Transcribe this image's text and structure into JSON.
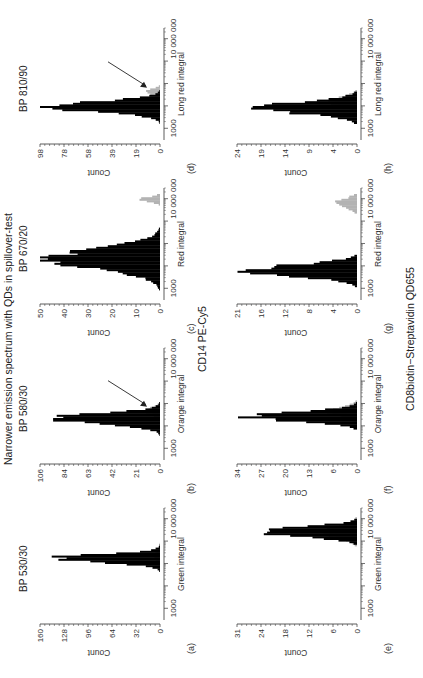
{
  "figure": {
    "title": "Narrower emission spectrum with QDs in spillover-test",
    "row_labels": [
      "CD14 PE-Cy5",
      "CD8biotin−Streptavidin QD655"
    ],
    "colors": {
      "primary": "#000000",
      "spillover": "#b3b3b3",
      "axis": "#333333"
    }
  },
  "panels": [
    {
      "id": "a",
      "label": "(a)",
      "title": "BP 530/30",
      "xlabel": "Green integral",
      "ylabel": "Count",
      "yticks": [
        "0",
        "32",
        "64",
        "96",
        "128",
        "160"
      ],
      "xticks": [
        "1000",
        "10 000 000"
      ],
      "arrow": false
    },
    {
      "id": "b",
      "label": "(b)",
      "title": "BP 580/30",
      "xlabel": "Orange integral",
      "ylabel": "Count",
      "yticks": [
        "0",
        "21",
        "42",
        "63",
        "84",
        "106"
      ],
      "xticks": [
        "1000",
        "10 000 000"
      ],
      "arrow": true
    },
    {
      "id": "c",
      "label": "(c)",
      "title": "BP 670/20",
      "xlabel": "Red integral",
      "ylabel": "Count",
      "yticks": [
        "0",
        "10",
        "20",
        "30",
        "40",
        "50"
      ],
      "xticks": [
        "1000",
        "10 000 000"
      ],
      "arrow": false
    },
    {
      "id": "d",
      "label": "(d)",
      "title": "BP 810/90",
      "xlabel": "Long red integral",
      "ylabel": "Count",
      "yticks": [
        "0",
        "19",
        "39",
        "58",
        "78",
        "98"
      ],
      "xticks": [
        "1000",
        "10 000 000"
      ],
      "arrow": true
    },
    {
      "id": "e",
      "label": "(e)",
      "title": "",
      "xlabel": "Green integral",
      "ylabel": "Count",
      "yticks": [
        "0",
        "6",
        "12",
        "18",
        "24",
        "31"
      ],
      "xticks": [
        "1000",
        "10 000 000"
      ],
      "arrow": false
    },
    {
      "id": "f",
      "label": "(f)",
      "title": "",
      "xlabel": "Orange integral",
      "ylabel": "Count",
      "yticks": [
        "0",
        "6",
        "13",
        "20",
        "27",
        "34"
      ],
      "xticks": [
        "1000",
        "10 000 000"
      ],
      "arrow": false
    },
    {
      "id": "g",
      "label": "(g)",
      "title": "",
      "xlabel": "Red integral",
      "ylabel": "Count",
      "yticks": [
        "0",
        "4",
        "8",
        "12",
        "16",
        "21"
      ],
      "xticks": [
        "1000",
        "10 000 000"
      ],
      "arrow": false
    },
    {
      "id": "h",
      "label": "(h)",
      "title": "",
      "xlabel": "Long red integral",
      "ylabel": "Count",
      "yticks": [
        "0",
        "4",
        "9",
        "14",
        "19",
        "24"
      ],
      "xticks": [
        "1000",
        "10 000 000"
      ],
      "arrow": false
    }
  ],
  "chart_data": [
    {
      "type": "bar",
      "panel": "a",
      "title": "BP 530/30",
      "xlabel": "Green integral (log)",
      "ylabel": "Count",
      "ylim": [
        0,
        160
      ],
      "xscale": "log",
      "xlim": [
        300,
        30000000
      ],
      "series": [
        {
          "name": "CD14 PE-Cy5",
          "color": "#000000",
          "peak_x": 160000,
          "peak_y": 155,
          "width_decades": 0.35
        },
        {
          "name": "spillover",
          "color": "#b3b3b3",
          "peak_x": 200000,
          "peak_y": 8,
          "width_decades": 0.5
        }
      ]
    },
    {
      "type": "bar",
      "panel": "b",
      "title": "BP 580/30",
      "xlabel": "Orange integral (log)",
      "ylabel": "Count",
      "ylim": [
        0,
        106
      ],
      "xscale": "log",
      "xlim": [
        300,
        30000000
      ],
      "series": [
        {
          "name": "CD14 PE-Cy5",
          "color": "#000000",
          "peak_x": 20000,
          "peak_y": 103,
          "width_decades": 0.45
        },
        {
          "name": "spillover",
          "color": "#b3b3b3",
          "peak_x": 45000,
          "peak_y": 14,
          "width_decades": 0.3
        }
      ]
    },
    {
      "type": "bar",
      "panel": "c",
      "title": "BP 670/20",
      "xlabel": "Red integral (log)",
      "ylabel": "Count",
      "ylim": [
        0,
        50
      ],
      "xscale": "log",
      "xlim": [
        300,
        30000000
      ],
      "series": [
        {
          "name": "CD14 PE-Cy5",
          "color": "#000000",
          "peak_x": 20000,
          "peak_y": 48,
          "width_decades": 0.9
        },
        {
          "name": "spillover",
          "color": "#b3b3b3",
          "peak_x": 9000000,
          "peak_y": 9,
          "width_decades": 0.2
        }
      ]
    },
    {
      "type": "bar",
      "panel": "d",
      "title": "BP 810/90",
      "xlabel": "Long red integral (log)",
      "ylabel": "Count",
      "ylim": [
        0,
        98
      ],
      "xscale": "log",
      "xlim": [
        300,
        30000000
      ],
      "series": [
        {
          "name": "CD14 PE-Cy5",
          "color": "#000000",
          "peak_x": 9000,
          "peak_y": 95,
          "width_decades": 0.45
        },
        {
          "name": "spillover",
          "color": "#b3b3b3",
          "peak_x": 40000,
          "peak_y": 12,
          "width_decades": 0.25
        }
      ]
    },
    {
      "type": "bar",
      "panel": "e",
      "xlabel": "Green integral (log)",
      "ylabel": "Count",
      "ylim": [
        0,
        31
      ],
      "xscale": "log",
      "xlim": [
        300,
        30000000
      ],
      "series": [
        {
          "name": "CD8biotin-Streptavidin QD655",
          "color": "#000000",
          "peak_x": 2500000,
          "peak_y": 30,
          "width_decades": 0.4
        },
        {
          "name": "spillover",
          "color": "#b3b3b3",
          "peak_x": 2500000,
          "peak_y": 10,
          "width_decades": 0.5
        }
      ]
    },
    {
      "type": "bar",
      "panel": "f",
      "xlabel": "Orange integral (log)",
      "ylabel": "Count",
      "ylim": [
        0,
        34
      ],
      "xscale": "log",
      "xlim": [
        300,
        30000000
      ],
      "series": [
        {
          "name": "CD8biotin-Streptavidin QD655",
          "color": "#000000",
          "peak_x": 25000,
          "peak_y": 33,
          "width_decades": 0.4
        },
        {
          "name": "spillover",
          "color": "#b3b3b3",
          "peak_x": 40000,
          "peak_y": 8,
          "width_decades": 0.4
        }
      ]
    },
    {
      "type": "bar",
      "panel": "g",
      "xlabel": "Red integral (log)",
      "ylabel": "Count",
      "ylim": [
        0,
        21
      ],
      "xscale": "log",
      "xlim": [
        300,
        30000000
      ],
      "series": [
        {
          "name": "CD8biotin-Streptavidin QD655",
          "color": "#000000",
          "peak_x": 6000,
          "peak_y": 20,
          "width_decades": 0.5
        },
        {
          "name": "spillover",
          "color": "#b3b3b3",
          "peak_x": 6000000,
          "peak_y": 4,
          "width_decades": 0.4
        }
      ]
    },
    {
      "type": "bar",
      "panel": "h",
      "xlabel": "Long red integral (log)",
      "ylabel": "Count",
      "ylim": [
        0,
        24
      ],
      "xscale": "log",
      "xlim": [
        300,
        30000000
      ],
      "series": [
        {
          "name": "CD8biotin-Streptavidin QD655",
          "color": "#000000",
          "peak_x": 8000,
          "peak_y": 22,
          "width_decades": 0.5
        },
        {
          "name": "spillover",
          "color": "#b3b3b3",
          "peak_x": 15000,
          "peak_y": 6,
          "width_decades": 0.4
        }
      ]
    }
  ]
}
